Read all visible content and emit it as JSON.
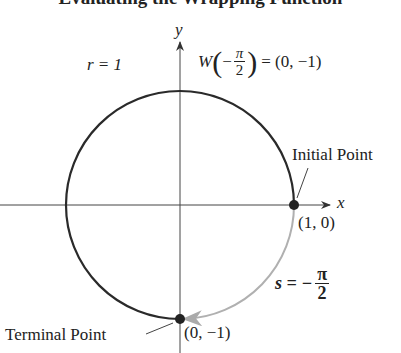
{
  "title": "Evaluating the Wrapping Function",
  "labels": {
    "y_axis": "y",
    "x_axis": "x",
    "radius": "r = 1",
    "function_lhs": "W",
    "function_arg_sign": "−",
    "function_arg_num": "π",
    "function_arg_den": "2",
    "function_rhs": "= (0, −1)",
    "initial_point": "Initial Point",
    "initial_coords": "(1, 0)",
    "arc_length_lhs": "s = −",
    "arc_length_num": "π",
    "arc_length_den": "2",
    "terminal_point": "Terminal Point",
    "terminal_coords": "(0, −1)"
  },
  "colors": {
    "circle": "#2a2a2a",
    "arc": "#b0b0b0",
    "axes": "#444444"
  }
}
